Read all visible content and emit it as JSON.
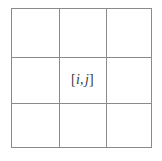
{
  "figure": {
    "type": "grid-diagram",
    "background_color": "#ffffff",
    "line_color": "#8a8a8a",
    "text_color": "#3a3a3a",
    "grid": {
      "rows": 3,
      "columns": 3,
      "x_left": 11,
      "x_right": 152,
      "y_top": 8,
      "y_bottom": 148,
      "vertical_lines": [
        11,
        59,
        106,
        152
      ],
      "horizontal_lines": [
        8,
        57,
        103,
        148
      ]
    },
    "center_label": {
      "full_text": "[i, j]",
      "open_bracket": "[",
      "row_index": "i",
      "separator": ",",
      "column_index": "j",
      "close_bracket": "]"
    }
  }
}
